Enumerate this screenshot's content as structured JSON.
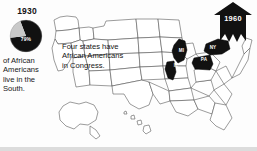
{
  "figure": {
    "type": "map-infographic",
    "background_color": "#fdfdfd",
    "ink_color": "#141414"
  },
  "legend": {
    "year": "1930",
    "pie": {
      "percent_label": "79%",
      "share_dark": 79,
      "share_light": 21,
      "dark_color": "#111111",
      "light_color": "#c9c9c9"
    },
    "caption": "of African Americans live in the South."
  },
  "callout": {
    "text": "Four states have African Americans in Congress."
  },
  "states": [
    {
      "abbr": "MI",
      "name": "Michigan"
    },
    {
      "abbr": "IL",
      "name": "Illinois"
    },
    {
      "abbr": "PA",
      "name": "Pennsylvania"
    },
    {
      "abbr": "NY",
      "name": "New York"
    }
  ],
  "arrow_banner": {
    "year": "1960",
    "direction": "up",
    "fill_color": "#111111"
  },
  "chart_data": {
    "type": "pie",
    "title": "1930",
    "labels": [
      "Live in the South",
      "Live outside the South"
    ],
    "values": [
      79,
      21
    ],
    "data_labels": [
      "79%",
      ""
    ],
    "colors": [
      "#111111",
      "#c9c9c9"
    ],
    "legend_position": "none",
    "annotation": "of African Americans live in the South."
  }
}
